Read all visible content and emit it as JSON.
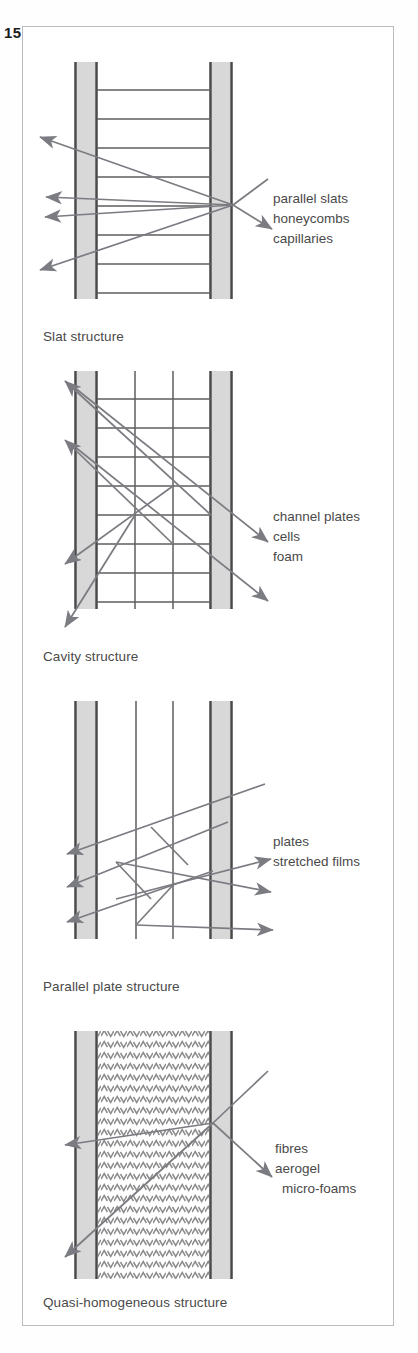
{
  "page": {
    "number": "15"
  },
  "colors": {
    "frame_border": "#b9bcc0",
    "wall_fill": "#d8d8d8",
    "wall_edge": "#4a4a4a",
    "structure_line": "#5e5e5e",
    "ray": "#7b7b82",
    "text": "#4a4a4a",
    "page_number": "#1d1d1d",
    "background": "#ffffff"
  },
  "panels": [
    {
      "id": "slat-structure",
      "caption": "Slat structure",
      "structure_type": "slat",
      "callout": {
        "lines": [
          "parallel slats",
          "honeycombs",
          "capillaries"
        ],
        "indent": [
          false,
          false,
          false
        ]
      },
      "geometry": {
        "left_wall_x": 51,
        "left_wall_w": 24,
        "right_wall_x": 186,
        "right_wall_w": 24,
        "top": 35,
        "bottom": 272,
        "rungs": 8,
        "vertical_dividers": 0
      }
    },
    {
      "id": "cavity-structure",
      "caption": "Cavity structure",
      "structure_type": "cavity",
      "callout": {
        "lines": [
          "channel plates",
          "cells",
          "foam"
        ],
        "indent": [
          false,
          false,
          false
        ]
      },
      "geometry": {
        "left_wall_x": 51,
        "left_wall_w": 24,
        "right_wall_x": 186,
        "right_wall_w": 24,
        "top": 14,
        "bottom": 252,
        "rungs": 8,
        "vertical_dividers": 2
      }
    },
    {
      "id": "parallel-plate-structure",
      "caption": "Parallel plate structure",
      "structure_type": "plates",
      "callout": {
        "lines": [
          "plates",
          "stretched films"
        ],
        "indent": [
          false,
          false
        ]
      },
      "geometry": {
        "left_wall_x": 51,
        "left_wall_w": 24,
        "right_wall_x": 186,
        "right_wall_w": 24,
        "top": 14,
        "bottom": 252,
        "rungs": 0,
        "vertical_dividers": 2
      }
    },
    {
      "id": "quasi-homogeneous-structure",
      "caption": "Quasi-homogeneous structure",
      "structure_type": "quasi-homogeneous",
      "callout": {
        "lines": [
          "fibres",
          "aerogel",
          "micro-foams"
        ],
        "indent": [
          false,
          false,
          true
        ]
      },
      "geometry": {
        "left_wall_x": 51,
        "left_wall_w": 24,
        "right_wall_x": 186,
        "right_wall_w": 24,
        "top": 14,
        "bottom": 262,
        "rungs": 0,
        "vertical_dividers": 0,
        "core_fill": "chevron-texture"
      }
    }
  ]
}
